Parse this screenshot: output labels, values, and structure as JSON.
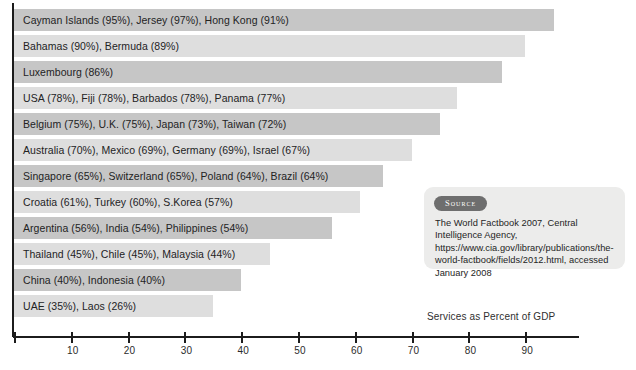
{
  "chart_data": {
    "type": "bar",
    "orientation": "horizontal",
    "title": "",
    "xlabel": "Services as Percent of GDP",
    "ylabel": "",
    "xlim": [
      0,
      99
    ],
    "xticks": [
      10,
      20,
      30,
      40,
      50,
      60,
      70,
      80,
      90
    ],
    "xticklabels": [
      "10",
      "20",
      "30",
      "40",
      "50",
      "60",
      "70",
      "80",
      "90"
    ],
    "grid": false,
    "legend": null,
    "categories": [
      "Cayman Islands (95%), Jersey (97%), Hong Kong (91%)",
      "Bahamas (90%), Bermuda (89%)",
      "Luxembourg (86%)",
      "USA (78%), Fiji (78%), Barbados (78%), Panama (77%)",
      "Belgium (75%), U.K. (75%), Japan (73%), Taiwan (72%)",
      "Australia (70%), Mexico (69%), Germany (69%), Israel (67%)",
      "Singapore (65%), Switzerland (65%), Poland (64%), Brazil (64%)",
      "Croatia (61%), Turkey (60%), S.Korea (57%)",
      "Argentina (56%), India (54%), Philippines (54%)",
      "Thailand (45%), Chile (45%), Malaysia (44%)",
      "China (40%), Indonesia (40%)",
      "UAE (35%), Laos (26%)"
    ],
    "values": [
      95,
      90,
      86,
      78,
      75,
      70,
      65,
      61,
      56,
      45,
      40,
      35
    ],
    "bars": [
      {
        "label": "Cayman Islands (95%), Jersey (97%), Hong Kong (91%)",
        "value": 95,
        "shade": "dark"
      },
      {
        "label": "Bahamas (90%), Bermuda (89%)",
        "value": 90,
        "shade": "light"
      },
      {
        "label": "Luxembourg (86%)",
        "value": 86,
        "shade": "dark"
      },
      {
        "label": "USA (78%), Fiji (78%), Barbados (78%), Panama (77%)",
        "value": 78,
        "shade": "light"
      },
      {
        "label": "Belgium (75%), U.K. (75%), Japan (73%), Taiwan (72%)",
        "value": 75,
        "shade": "dark"
      },
      {
        "label": "Australia (70%), Mexico (69%), Germany (69%), Israel (67%)",
        "value": 70,
        "shade": "light"
      },
      {
        "label": "Singapore (65%), Switzerland (65%), Poland (64%), Brazil (64%)",
        "value": 65,
        "shade": "dark"
      },
      {
        "label": "Croatia (61%), Turkey (60%), S.Korea (57%)",
        "value": 61,
        "shade": "light"
      },
      {
        "label": "Argentina (56%), India (54%), Philippines (54%)",
        "value": 56,
        "shade": "dark"
      },
      {
        "label": "Thailand (45%), Chile (45%), Malaysia (44%)",
        "value": 45,
        "shade": "light"
      },
      {
        "label": "China (40%), Indonesia (40%)",
        "value": 40,
        "shade": "dark"
      },
      {
        "label": "UAE (35%), Laos (26%)",
        "value": 35,
        "shade": "light"
      }
    ],
    "colors": {
      "bar_dark": "#c6c6c6",
      "bar_light": "#dedede",
      "axis": "#1c1c1c",
      "text": "#23231f",
      "source_pill": "#6e6e6e",
      "source_background": "#ececeb"
    }
  },
  "source": {
    "pill_label": "Source",
    "text": "The World Factbook 2007, Central Intelligence Agency, https://www.cia.gov/library/publications/the-world-factbook/fields/2012.html, accessed January 2008"
  }
}
